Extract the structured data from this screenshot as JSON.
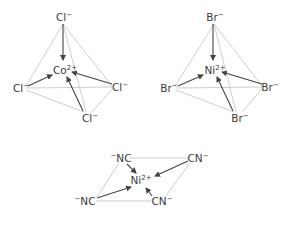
{
  "diagrams": [
    {
      "id": "cocl4",
      "geometry": "tetrahedral",
      "center": {
        "symbol": "Co",
        "charge": "2+"
      },
      "ligands": [
        {
          "symbol": "Cl",
          "charge": "−",
          "position": "top"
        },
        {
          "symbol": "Cl",
          "charge": "−",
          "position": "left"
        },
        {
          "symbol": "Cl",
          "charge": "−",
          "position": "right"
        },
        {
          "symbol": "Cl",
          "charge": "−",
          "position": "bottom"
        }
      ]
    },
    {
      "id": "nibr4",
      "geometry": "tetrahedral",
      "center": {
        "symbol": "Ni",
        "charge": "2+"
      },
      "ligands": [
        {
          "symbol": "Br",
          "charge": "−",
          "position": "top"
        },
        {
          "symbol": "Br",
          "charge": "−",
          "position": "left"
        },
        {
          "symbol": "Br",
          "charge": "−",
          "position": "right"
        },
        {
          "symbol": "Br",
          "charge": "−",
          "position": "bottom"
        }
      ]
    },
    {
      "id": "nicn4",
      "geometry": "square-planar",
      "center": {
        "symbol": "Ni",
        "charge": "2+"
      },
      "ligands": [
        {
          "symbol": "NC",
          "charge": "−",
          "position": "top-left",
          "charge_side": "pre"
        },
        {
          "symbol": "CN",
          "charge": "−",
          "position": "top-right",
          "charge_side": "post"
        },
        {
          "symbol": "NC",
          "charge": "−",
          "position": "bottom-left",
          "charge_side": "pre"
        },
        {
          "symbol": "CN",
          "charge": "−",
          "position": "bottom-right",
          "charge_side": "post"
        }
      ]
    }
  ]
}
